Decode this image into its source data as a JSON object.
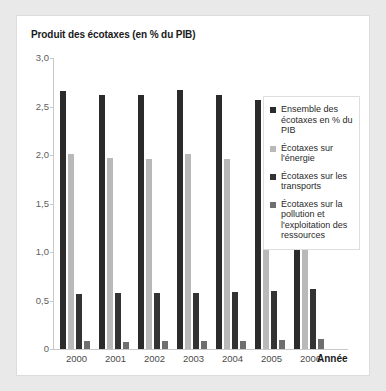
{
  "card": {
    "title": "Produit des écotaxes (en % du PIB)"
  },
  "chart_data": {
    "type": "bar",
    "title": "Produit des écotaxes (en % du PIB)",
    "xlabel": "Année",
    "ylabel": "",
    "ylim": [
      0,
      3.0
    ],
    "ytick_labels": [
      "0",
      "0,5",
      "1,0",
      "1,5",
      "2,0",
      "2,5",
      "3,0"
    ],
    "ytick_values": [
      0,
      0.5,
      1.0,
      1.5,
      2.0,
      2.5,
      3.0
    ],
    "grid": false,
    "legend_position": "right",
    "categories": [
      "2000",
      "2001",
      "2002",
      "2003",
      "2004",
      "2005",
      "2006"
    ],
    "series": [
      {
        "name": "Ensemble des écotaxes en % du PIB",
        "color": "#2b2b2b",
        "values": [
          2.66,
          2.62,
          2.62,
          2.67,
          2.62,
          2.57,
          2.51
        ]
      },
      {
        "name": "Écotaxes sur l'énergie",
        "color": "#b9b9b9",
        "values": [
          2.01,
          1.97,
          1.96,
          2.01,
          1.96,
          1.89,
          1.82
        ]
      },
      {
        "name": "Écotaxes sur les transports",
        "color": "#333333",
        "values": [
          0.57,
          0.58,
          0.58,
          0.58,
          0.59,
          0.6,
          0.62
        ]
      },
      {
        "name": "Écotaxes sur la pollution et l'exploitation des ressources",
        "color": "#6f6f6f",
        "values": [
          0.08,
          0.07,
          0.08,
          0.08,
          0.08,
          0.09,
          0.1
        ]
      }
    ]
  },
  "legend": {
    "items": [
      {
        "label": "Ensemble des écotaxes en % du PIB",
        "color": "#2b2b2b"
      },
      {
        "label": "Écotaxes sur l'énergie",
        "color": "#b9b9b9"
      },
      {
        "label": "Écotaxes sur les transports",
        "color": "#333333"
      },
      {
        "label": "Écotaxes sur la pollution et l'exploitation des ressources",
        "color": "#6f6f6f"
      }
    ]
  },
  "axes": {
    "x_title": "Année"
  }
}
